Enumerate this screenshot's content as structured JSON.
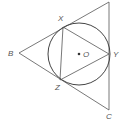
{
  "diagram": {
    "points": {
      "B": "B",
      "C": "C",
      "X": "X",
      "Y": "Y",
      "Z": "Z",
      "O": "O"
    },
    "center_label": "O",
    "colors": {
      "lines": "#555555",
      "circle": "#444444",
      "labels": "#555555"
    }
  }
}
